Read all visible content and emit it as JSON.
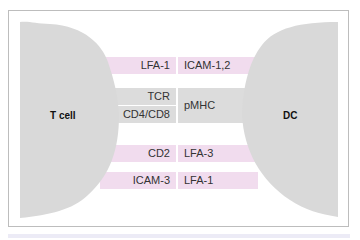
{
  "diagram": {
    "cells": {
      "left": {
        "label": "T cell",
        "color": "#d9d9d9"
      },
      "right": {
        "label": "DC",
        "color": "#d9d9d9"
      }
    },
    "interactions": [
      {
        "left": "LFA-1",
        "right": "ICAM-1,2",
        "color": "#f1dcee"
      },
      {
        "left": "TCR",
        "right": "pMHC",
        "color": "#dcdcdc"
      },
      {
        "left": "CD4/CD8",
        "right": "pMHC",
        "color": "#dcdcdc"
      },
      {
        "left": "CD2",
        "right": "LFA-3",
        "color": "#f1dcee"
      },
      {
        "left": "ICAM-3",
        "right": "LFA-1",
        "color": "#f1dcee"
      }
    ]
  }
}
